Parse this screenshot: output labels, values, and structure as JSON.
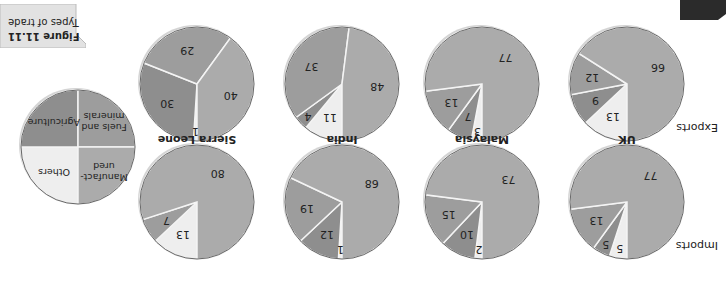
{
  "figure": {
    "label": "Figure 11.11",
    "caption": "Types of trade",
    "rotation_deg": 180
  },
  "rows": {
    "imports": "Imports",
    "exports": "Exports"
  },
  "legend": {
    "items": [
      {
        "key": "others",
        "label": "Others",
        "color": "#eeeeee"
      },
      {
        "key": "agriculture",
        "label": "Agriculture",
        "color": "#8e8e8e"
      },
      {
        "key": "fuels",
        "label": "Fuels and minerals",
        "color": "#9d9d9d"
      },
      {
        "key": "manufactured",
        "label": "Manufact-ured",
        "color": "#ababab"
      }
    ]
  },
  "countries": [
    "UK",
    "Malaysia",
    "India",
    "Sierra Leone"
  ],
  "chart_data": {
    "type": "pie",
    "title": "Figure 11.11 Types of trade",
    "categories": [
      "Others",
      "Agriculture",
      "Fuels and minerals",
      "Manufactured"
    ],
    "colors": [
      "#eeeeee",
      "#8e8e8e",
      "#9d9d9d",
      "#ababab"
    ],
    "note": "Image is rendered rotated 180 degrees",
    "pies": [
      {
        "country": "UK",
        "row": "Imports",
        "values": [
          5,
          5,
          13,
          77
        ]
      },
      {
        "country": "Malaysia",
        "row": "Imports",
        "values": [
          2,
          10,
          15,
          73
        ]
      },
      {
        "country": "India",
        "row": "Imports",
        "values": [
          1,
          12,
          19,
          68
        ]
      },
      {
        "country": "Sierra Leone",
        "row": "Imports",
        "values": [
          13,
          0,
          7,
          80
        ]
      },
      {
        "country": "UK",
        "row": "Exports",
        "values": [
          13,
          9,
          12,
          66
        ]
      },
      {
        "country": "Malaysia",
        "row": "Exports",
        "values": [
          3,
          7,
          13,
          77
        ]
      },
      {
        "country": "India",
        "row": "Exports",
        "values": [
          11,
          4,
          37,
          48
        ]
      },
      {
        "country": "Sierra Leone",
        "row": "Exports",
        "values": [
          1,
          30,
          29,
          40
        ]
      }
    ]
  }
}
